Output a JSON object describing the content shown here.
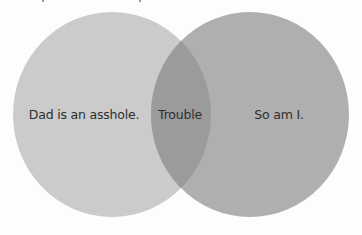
{
  "diagram": {
    "type": "venn",
    "background": "#fdfdfd",
    "sets": [
      {
        "id": "left",
        "label": "Dad is an asshole.",
        "color": "#cbcbcb"
      },
      {
        "id": "right",
        "label": "So am I.",
        "color": "#afafaf"
      }
    ],
    "intersection": {
      "label": "Trouble",
      "color": "#9b9b9b"
    }
  }
}
